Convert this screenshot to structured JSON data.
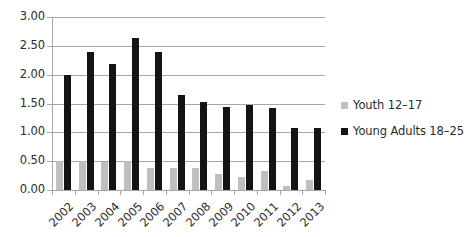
{
  "chart_data": {
    "type": "bar",
    "title": "",
    "subtitle": "",
    "xlabel": "",
    "ylabel": "",
    "categories": [
      "2002",
      "2003",
      "2004",
      "2005",
      "2006",
      "2007",
      "2008",
      "2009",
      "2010",
      "2011",
      "2012",
      "2013"
    ],
    "series": [
      {
        "name": "Youth 12–17",
        "color": "#bfbfbf",
        "values": [
          0.51,
          0.51,
          0.49,
          0.51,
          0.39,
          0.38,
          0.39,
          0.28,
          0.23,
          0.33,
          0.07,
          0.17
        ]
      },
      {
        "name": "Young Adults 18–25",
        "color": "#141414",
        "values": [
          2.0,
          2.39,
          2.19,
          2.64,
          2.39,
          1.64,
          1.53,
          1.44,
          1.48,
          1.43,
          1.07,
          1.07
        ]
      }
    ],
    "ylim": [
      0,
      3.0
    ],
    "ytick_step": 0.5,
    "ytick_labels": [
      "0.00",
      "0.50",
      "1.00",
      "1.50",
      "2.00",
      "2.50",
      "3.00"
    ],
    "ytick_values": [
      0.0,
      0.5,
      1.0,
      1.5,
      2.0,
      2.5,
      3.0
    ],
    "grid": true,
    "grid_axis": "y",
    "grid_color": "#a6a6a6",
    "legend_position": "right",
    "background_color": "#ffffff",
    "text_color": "#2b2b2b",
    "xtick_rotation": -45
  },
  "legend": {
    "items": [
      {
        "label": "Youth 12–17",
        "color": "#bfbfbf"
      },
      {
        "label": "Young Adults 18–25",
        "color": "#141414"
      }
    ]
  }
}
